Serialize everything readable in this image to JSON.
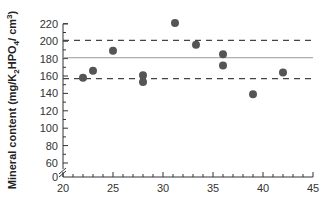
{
  "chart_data": {
    "type": "scatter",
    "title": "",
    "xlabel": "",
    "ylabel": "Mineral content (mg/K2HPO4/cm3)",
    "ylabel_parts": {
      "main": "Mineral content (mg/K",
      "sub1": "2",
      "mid": "HPO",
      "sub2": "4",
      "end": "/ cm",
      "sup": "3",
      "close": ")"
    },
    "xlim": [
      20,
      45
    ],
    "ylim": [
      0,
      220
    ],
    "y_axis_break": true,
    "xticks": [
      20,
      25,
      30,
      35,
      40,
      45
    ],
    "yticks": [
      0,
      60,
      80,
      100,
      120,
      140,
      160,
      180,
      200,
      220
    ],
    "grid": false,
    "points": [
      {
        "x": 22,
        "y": 158
      },
      {
        "x": 23,
        "y": 166
      },
      {
        "x": 25,
        "y": 189
      },
      {
        "x": 28,
        "y": 161
      },
      {
        "x": 28,
        "y": 153
      },
      {
        "x": 31.2,
        "y": 221
      },
      {
        "x": 33.3,
        "y": 196
      },
      {
        "x": 36,
        "y": 185
      },
      {
        "x": 36,
        "y": 172
      },
      {
        "x": 39,
        "y": 139
      },
      {
        "x": 42,
        "y": 164
      }
    ],
    "reference_lines": [
      {
        "name": "mean",
        "style": "solid",
        "y": 181
      },
      {
        "name": "upper-bound",
        "style": "dashed",
        "y": 201
      },
      {
        "name": "lower-bound",
        "style": "dashed",
        "y": 157
      }
    ],
    "colors": {
      "point": "#555555",
      "axis": "#333333",
      "line": "#999999",
      "dashed": "#444444"
    }
  }
}
